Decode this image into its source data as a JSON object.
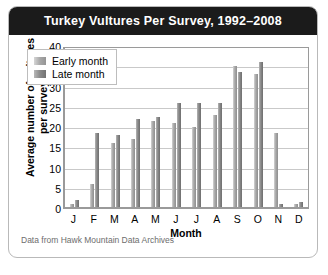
{
  "figure": {
    "title": "Turkey Vultures Per Survey, 1992–2008",
    "source_note": "Data from Hawk Mountain Data Archives"
  },
  "legend": {
    "position": "top-left-inside",
    "entries": [
      {
        "label": "Early month",
        "swatch": "light-gray"
      },
      {
        "label": "Late month",
        "swatch": "dark-gray"
      }
    ]
  },
  "chart_data": {
    "type": "bar",
    "title": "Turkey Vultures Per Survey, 1992–2008",
    "xlabel": "Month",
    "ylabel": "Average number of vultures per survey",
    "categories": [
      "J",
      "F",
      "M",
      "A",
      "M",
      "J",
      "J",
      "A",
      "S",
      "O",
      "N",
      "D"
    ],
    "series": [
      {
        "name": "Early month",
        "values": [
          1,
          6,
          16,
          17,
          21.5,
          21,
          20,
          23,
          35,
          33,
          18.5,
          1
        ]
      },
      {
        "name": "Late month",
        "values": [
          2,
          18.5,
          18,
          22,
          22.5,
          26,
          26,
          26,
          33.5,
          36,
          1,
          1.5
        ]
      }
    ],
    "ylim": [
      0,
      40
    ],
    "yticks": [
      0,
      5,
      10,
      15,
      20,
      25,
      30,
      35,
      40
    ],
    "grid": true
  },
  "colors": {
    "title_bar": "#1b1b1b",
    "title_text": "#ffffff",
    "early_bar": "#a8a8a8",
    "late_bar": "#8a8a8a",
    "gridline": "#c9c9c9",
    "axis": "#9a9a9a"
  }
}
